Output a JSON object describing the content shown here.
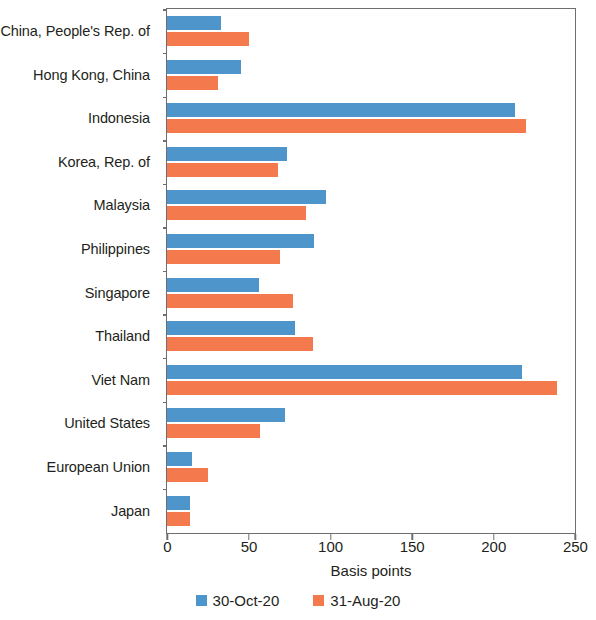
{
  "chart_data": {
    "type": "bar",
    "orientation": "horizontal",
    "title": "",
    "xlabel": "Basis points",
    "ylabel": "",
    "xlim": [
      0,
      250
    ],
    "xticks": [
      0,
      50,
      100,
      150,
      200,
      250
    ],
    "xtick_labels": [
      "0",
      "50",
      "100",
      "150",
      "200",
      "250"
    ],
    "grid": false,
    "legend_position": "bottom",
    "categories": [
      "China, People's Rep. of",
      "Hong Kong, China",
      "Indonesia",
      "Korea, Rep. of",
      "Malaysia",
      "Philippines",
      "Singapore",
      "Thailand",
      "Viet Nam",
      "United States",
      "European Union",
      "Japan"
    ],
    "series": [
      {
        "name": "30-Oct-20",
        "color": "#4e95cb",
        "values": [
          33,
          45,
          213,
          73,
          97,
          90,
          56,
          78,
          217,
          72,
          15,
          14
        ]
      },
      {
        "name": "31-Aug-20",
        "color": "#f4794c",
        "values": [
          50,
          31,
          220,
          68,
          85,
          69,
          77,
          89,
          239,
          57,
          25,
          14
        ]
      }
    ]
  },
  "legend": [
    {
      "label": "30-Oct-20",
      "swatch": "blue"
    },
    {
      "label": "31-Aug-20",
      "swatch": "orange"
    }
  ],
  "colors": {
    "blue": "#4e95cb",
    "orange": "#f4794c",
    "axis": "#6e6e72",
    "text": "#231f20",
    "background": "#ffffff"
  }
}
